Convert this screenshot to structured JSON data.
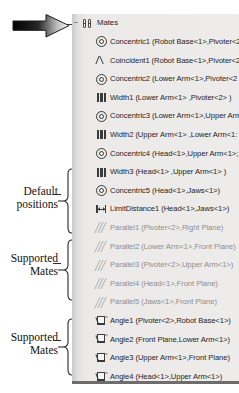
{
  "tree": {
    "root": {
      "label": "Mates",
      "icon": "mates-folder-icon",
      "expander": "–"
    },
    "items": [
      {
        "icon": "concentric-icon",
        "type": "concentric",
        "label": "Concentric1 (Robot Base<1>,Pivoter<2",
        "dim": false
      },
      {
        "icon": "coincident-icon",
        "type": "coincident",
        "label": "Coincident1 (Robot Base<1>,Pivoter<2",
        "dim": false
      },
      {
        "icon": "concentric-icon",
        "type": "concentric",
        "label": "Concentric2 (Lower Arm<1>,Pivoter<2",
        "dim": false
      },
      {
        "icon": "width-icon",
        "type": "width",
        "label": "Width1 (Lower Arm<1> ,Pivoter<2> )",
        "dim": false
      },
      {
        "icon": "concentric-icon",
        "type": "concentric",
        "label": "Concentric3 (Lower Arm<1>,Upper Arm",
        "dim": false
      },
      {
        "icon": "width-icon",
        "type": "width",
        "label": "Width2 (Upper Arm<1> ,Lower Arm<1:",
        "dim": false
      },
      {
        "icon": "concentric-icon",
        "type": "concentric",
        "label": "Concentric4 (Head<1>,Upper Arm<1>;",
        "dim": false
      },
      {
        "icon": "width-icon",
        "type": "width",
        "label": "Width3 (Head<1> ,Upper Arm<1> )",
        "dim": false
      },
      {
        "icon": "concentric-icon",
        "type": "concentric",
        "label": "Concentric5 (Head<1>,Jaws<1>)",
        "dim": false
      },
      {
        "icon": "limit-distance-icon",
        "type": "limit",
        "label": "LimitDistance1 (Head<1>,Jaws<1>)",
        "dim": false
      },
      {
        "icon": "parallel-icon",
        "type": "parallel",
        "label": "Parallel1 (Pivoter<2>,Right Plane)",
        "dim": true
      },
      {
        "icon": "parallel-icon",
        "type": "parallel",
        "label": "Parallel2 (Lower Arm<1>,Front Plane)",
        "dim": true
      },
      {
        "icon": "parallel-icon",
        "type": "parallel",
        "label": "Parallel3 (Pivoter<2>,Upper Arm<1>)",
        "dim": true
      },
      {
        "icon": "parallel-icon",
        "type": "parallel",
        "label": "Parallel4 (Head<1>,Front Plane)",
        "dim": true
      },
      {
        "icon": "parallel-icon",
        "type": "parallel",
        "label": "Parallel5 (Jaws<1>,Front Plane)",
        "dim": true
      },
      {
        "icon": "angle-icon",
        "type": "angle",
        "label": "Angle1 (Pivoter<2>,Robot Base<1>)",
        "dim": false
      },
      {
        "icon": "angle-icon",
        "type": "angle",
        "label": "Angle2 (Front Plane,Lower Arm<1>)",
        "dim": false
      },
      {
        "icon": "angle-icon",
        "type": "angle",
        "label": "Angle3 (Upper Arm<1>,Front Plane)",
        "dim": false
      },
      {
        "icon": "angle-icon",
        "type": "angle",
        "label": "Angle4 (Head<1>,Upper Arm<1>)",
        "dim": false
      },
      {
        "icon": "angle-icon",
        "type": "angle",
        "label": "Angle5 (Jaws<1>,Head<1>)",
        "dim": false
      },
      {
        "icon": "coincident-icon",
        "type": "coincident",
        "label": "Coincident2 (Jaws<1>,Left Jaw<1>)",
        "dim": false
      },
      {
        "icon": "coincident-icon",
        "type": "coincident",
        "label": "Coincident3 (Jaws<1>,Right Jaw<1>)",
        "dim": false
      },
      {
        "icon": "width-icon",
        "type": "width",
        "label": "Width4 (Jaws<1> ,Left Jaw<1> )",
        "dim": false
      },
      {
        "icon": "width-icon",
        "type": "width",
        "label": "Width5 (Jaws<1> ,Right Jaw<1> )",
        "dim": false
      },
      {
        "icon": "limit-distance-icon",
        "type": "limit",
        "label": "LimitDistance2 (Jaws<1>,Right Jaw<1>",
        "dim": false
      },
      {
        "icon": "limit-distance-icon",
        "type": "limit",
        "label": "LimitDistance3 (Jaws<1>,Left Jaw<1>)",
        "dim": false
      }
    ]
  },
  "annotations": {
    "default_positions": "Default\npositions",
    "default_positions_line1": "Default",
    "default_positions_line2": "positions",
    "supported_mates_1_line1": "Supported",
    "supported_mates_1_line2": "Mates",
    "supported_mates_2_line1": "Supported",
    "supported_mates_2_line2": "Mates",
    "pointer_arrow": "arrow-pointing-to-mates-folder"
  },
  "colors": {
    "panel_bg": "#eceae8",
    "panel_edge": "#c9c9c9",
    "text": "#1d1d1d",
    "dim_text": "#8e8e8e",
    "icon_stroke": "#3b3b3b",
    "rule": "#6d6d6d"
  }
}
